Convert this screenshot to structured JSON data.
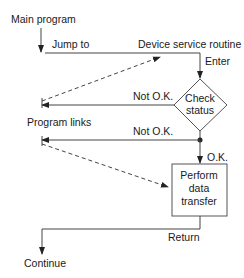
{
  "diagram": {
    "labels": {
      "main_program": "Main program",
      "jump_to": "Jump to",
      "device_service_routine": "Device service routine",
      "enter": "Enter",
      "not_ok_1": "Not O.K.",
      "program_links": "Program links",
      "not_ok_2": "Not O.K.",
      "ok": "O.K.",
      "return": "Return",
      "continue": "Continue"
    },
    "decision": {
      "line1": "Check",
      "line2": "status"
    },
    "process": {
      "line1": "Perform",
      "line2": "data",
      "line3": "transfer"
    }
  }
}
